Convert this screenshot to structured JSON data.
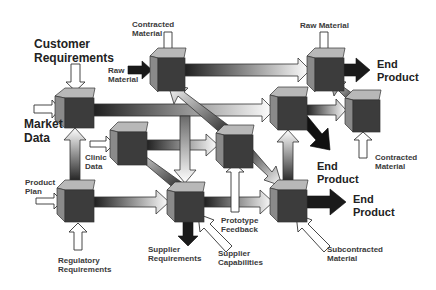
{
  "diagram": {
    "type": "process-network",
    "nodes": [
      {
        "id": "A",
        "role": "customer-market-node"
      },
      {
        "id": "B",
        "role": "contracted-material-node"
      },
      {
        "id": "C",
        "role": "raw-material-end-product-node"
      },
      {
        "id": "D",
        "role": "clinic-data-node"
      },
      {
        "id": "E",
        "role": "prototype-node"
      },
      {
        "id": "F",
        "role": "mid-right-node"
      },
      {
        "id": "G",
        "role": "contracted-material-node-right"
      },
      {
        "id": "H",
        "role": "product-plan-node"
      },
      {
        "id": "I",
        "role": "supplier-node"
      },
      {
        "id": "J",
        "role": "subcontracted-node"
      }
    ],
    "labels": {
      "customer_requirements_1": "Customer",
      "customer_requirements_2": "Requirements",
      "contracted_material_top_1": "Contracted",
      "contracted_material_top_2": "Material",
      "raw_material_left_1": "Raw",
      "raw_material_left_2": "Material",
      "raw_material_top": "Raw Material",
      "end_product_top_1": "End",
      "end_product_top_2": "Product",
      "market_data_1": "Market",
      "market_data_2": "Data",
      "clinic_data_1": "Clinic",
      "clinic_data_2": "Data",
      "end_product_mid_1": "End",
      "end_product_mid_2": "Product",
      "contracted_material_right_1": "Contracted",
      "contracted_material_right_2": "Material",
      "product_plan_1": "Product",
      "product_plan_2": "Plan",
      "end_product_bottom_1": "End",
      "end_product_bottom_2": "Product",
      "prototype_feedback_1": "Prototype",
      "prototype_feedback_2": "Feedback",
      "supplier_requirements_1": "Supplier",
      "supplier_requirements_2": "Requirements",
      "supplier_capabilities_1": "Supplier",
      "supplier_capabilities_2": "Capabilities",
      "subcontracted_material_1": "Subcontracted",
      "subcontracted_material_2": "Material",
      "regulatory_requirements_1": "Regulatory",
      "regulatory_requirements_2": "Requirements"
    },
    "colors": {
      "cube_top": "#b8b8b8",
      "cube_left": "#8a8a8a",
      "cube_front": "#3c3c3c",
      "arrow_dark": "#1a1a1a",
      "arrow_light": "#ffffff"
    }
  }
}
